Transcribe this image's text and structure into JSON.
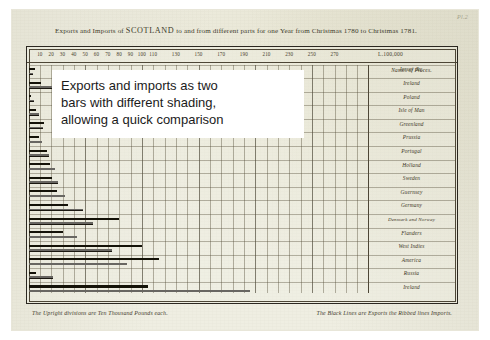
{
  "plate": {
    "number": "Pl.2"
  },
  "header": {
    "title_part1": "Exports and Imports of ",
    "title_caps": "SCOTLAND",
    "title_part2": " to and from different parts for one Year from Christmas 1780 to Christmas 1781."
  },
  "footer": {
    "left_note": "The Upright divisions are Ten Thousand Pounds each.",
    "right_note": "The Black Lines are Exports the Ribbed lines Imports."
  },
  "annotation": {
    "line1": "Exports and imports as two",
    "line2": "bars with different shading,",
    "line3": "allowing a quick comparison"
  },
  "names_header": "Names of Places.",
  "colors": {
    "paper": "#efeee2",
    "ink": "#2b2720",
    "exports_bar": "#141208",
    "imports_bar": "#1a1710",
    "annotation_bg": "#ffffff",
    "annotation_text": "#1b1b1b"
  },
  "chart_data": {
    "type": "bar",
    "title": "Exports and Imports of SCOTLAND to and from different parts for one Year from Christmas 1780 to Christmas 1781.",
    "orientation": "horizontal",
    "xlabel": "L.100,000",
    "ylabel": "Names of Places.",
    "unit_note": "The Upright divisions are Ten Thousand Pounds each.",
    "series_note": "The Black Lines are Exports the Ribbed lines Imports.",
    "grid": true,
    "legend_position": "footer-caption",
    "xlim": [
      0,
      300
    ],
    "xticks": [
      10,
      20,
      30,
      40,
      50,
      60,
      70,
      80,
      90,
      100,
      110,
      130,
      150,
      170,
      190,
      210,
      230,
      250,
      270
    ],
    "xtick_labels": [
      "10",
      "20",
      "30",
      "40",
      "50",
      "60",
      "70",
      "80",
      "90",
      "100",
      "110",
      "130",
      "150",
      "170",
      "190",
      "210",
      "230",
      "250",
      "270"
    ],
    "x_unit_label": "L.100,000",
    "categories": [
      "Jersey &c.",
      "Ireland",
      "Poland",
      "Isle of Man",
      "Greenland",
      "Prussia",
      "Portugal",
      "Holland",
      "Sweden",
      "Guernsey",
      "Germany",
      "Denmark and Norway",
      "Flanders",
      "West Indies",
      "America",
      "Russia",
      "Ireland"
    ],
    "series": [
      {
        "name": "Exports",
        "style": "black solid line",
        "values": [
          6,
          11,
          2,
          7,
          14,
          9,
          16,
          19,
          21,
          25,
          35,
          80,
          30,
          100,
          115,
          7,
          105
        ]
      },
      {
        "name": "Imports",
        "style": "ribbed (hatched) line",
        "values": [
          4,
          22,
          5,
          9,
          13,
          12,
          18,
          23,
          26,
          32,
          48,
          57,
          43,
          74,
          87,
          22,
          195
        ]
      }
    ]
  },
  "plot_geometry": {
    "note": "bar pixel lengths are derived in template from chart_data values",
    "px_per_unit": 1.07,
    "row_height": 13.4
  }
}
